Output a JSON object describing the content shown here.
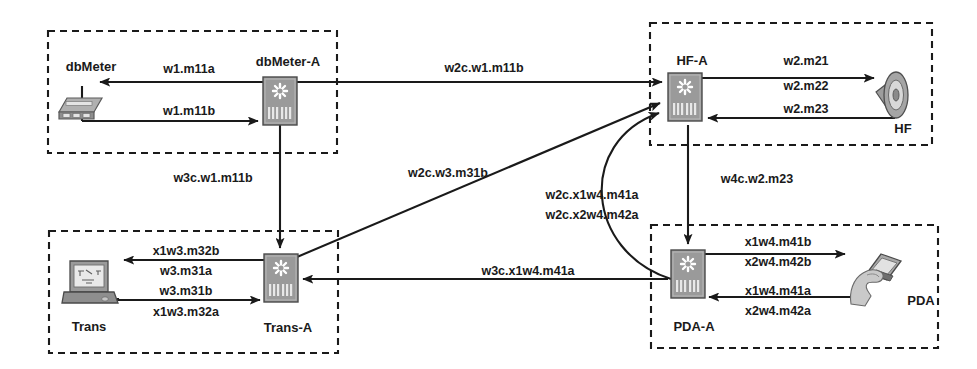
{
  "diagram": {
    "background_color": "#ffffff",
    "line_color": "#1a1a1a",
    "device_fill": "#9a9a9a",
    "device_stroke": "#4a4a4a"
  },
  "groups": [
    {
      "id": "dbmeter-group",
      "x": 48,
      "y": 31,
      "w": 289,
      "h": 122
    },
    {
      "id": "hf-group",
      "x": 650,
      "y": 23,
      "w": 282,
      "h": 122
    },
    {
      "id": "trans-group",
      "x": 49,
      "y": 231,
      "w": 289,
      "h": 122
    },
    {
      "id": "pda-group",
      "x": 651,
      "y": 225,
      "w": 287,
      "h": 123
    }
  ],
  "nodes": [
    {
      "id": "dbmeter",
      "label": "dbMeter",
      "kind": "meter-device",
      "label_x": 91,
      "label_y": 68,
      "icon_x": 60,
      "icon_y": 92,
      "icon_w": 46,
      "icon_h": 30
    },
    {
      "id": "dbmeter-a",
      "label": "dbMeter-A",
      "kind": "switch-device",
      "label_x": 288,
      "label_y": 63,
      "icon_x": 263,
      "icon_y": 77,
      "icon_w": 34,
      "icon_h": 48
    },
    {
      "id": "hf-a",
      "label": "HF-A",
      "kind": "switch-device",
      "label_x": 692,
      "label_y": 62,
      "icon_x": 668,
      "icon_y": 73,
      "icon_w": 34,
      "icon_h": 48
    },
    {
      "id": "hf",
      "label": "HF",
      "kind": "speaker-device",
      "label_x": 903,
      "label_y": 130,
      "icon_x": 880,
      "icon_y": 74,
      "icon_w": 34,
      "icon_h": 46
    },
    {
      "id": "trans",
      "label": "Trans",
      "kind": "laptop-device",
      "label_x": 89,
      "label_y": 328,
      "icon_x": 62,
      "icon_y": 259,
      "icon_w": 56,
      "icon_h": 52
    },
    {
      "id": "trans-a",
      "label": "Trans-A",
      "kind": "switch-device",
      "label_x": 288,
      "label_y": 329,
      "icon_x": 264,
      "icon_y": 254,
      "icon_w": 34,
      "icon_h": 48
    },
    {
      "id": "pda-a",
      "label": "PDA-A",
      "kind": "switch-device",
      "label_x": 694,
      "label_y": 328,
      "icon_x": 671,
      "icon_y": 250,
      "icon_w": 34,
      "icon_h": 48
    },
    {
      "id": "pda",
      "label": "PDA",
      "kind": "pda-device",
      "label_x": 921,
      "label_y": 302,
      "icon_x": 843,
      "icon_y": 255,
      "icon_w": 62,
      "icon_h": 56
    }
  ],
  "links": [
    {
      "id": "dbmeter-in",
      "label": "w1.m11a",
      "label_x": 189,
      "label_y": 70,
      "path": "M 263 82 L 100 82",
      "arrow": "end"
    },
    {
      "id": "dbmeter-out",
      "label": "w1.m11b",
      "label_x": 189,
      "label_y": 113,
      "path": "M 82 121 L 260 121",
      "arrow": "end"
    },
    {
      "id": "dbmeter-a-to-hf-a",
      "label": "w2c.w1.m11b",
      "label_x": 484,
      "label_y": 69,
      "path": "M 298 82 L 664 82",
      "arrow": "end"
    },
    {
      "id": "dbmeter-a-to-trans-a",
      "label": "w3c.w1.m11b",
      "label_x": 213,
      "label_y": 179,
      "path": "M 280 125 L 280 250",
      "arrow": "end"
    },
    {
      "id": "hf-a-to-hf-m21",
      "label": "w2.m21",
      "label_x": 806,
      "label_y": 62,
      "path": "M 702 78 L 878 78",
      "arrow": "end"
    },
    {
      "id": "hf-a-hf-m22",
      "label": "w2.m22",
      "label_x": 806,
      "label_y": 86,
      "path": "",
      "arrow": "none"
    },
    {
      "id": "hf-to-hf-a-m23",
      "label": "w2.m23",
      "label_x": 806,
      "label_y": 111,
      "path": "M 884 118 L 706 118",
      "arrow": "end"
    },
    {
      "id": "hf-a-to-pda-a",
      "label": "w4c.w2.m23",
      "label_x": 757,
      "label_y": 180,
      "path": "M 688 125 L 688 246",
      "arrow": "end"
    },
    {
      "id": "trans-a-to-hf-a",
      "label": "w2c.w3.m31b",
      "label_x": 448,
      "label_y": 174,
      "path": "M 296 258 L 662 105",
      "arrow": "end"
    },
    {
      "id": "pda-a-to-hf-a-1",
      "label": "w2c.x1w4.m41a",
      "label_x": 592,
      "label_y": 196,
      "path": "M 672 277 C 590 250 580 140 662 114",
      "arrow": "end"
    },
    {
      "id": "pda-a-to-hf-a-2",
      "label": "w2c.x2w4.m42a",
      "label_x": 592,
      "label_y": 215,
      "path": "",
      "arrow": "none"
    },
    {
      "id": "pda-a-to-trans-a",
      "label": "w3c.x1w4.m41a",
      "label_x": 528,
      "label_y": 272,
      "path": "M 668 279 L 302 279",
      "arrow": "end"
    },
    {
      "id": "trans-in-m32b",
      "label": "x1w3.m32b",
      "label_x": 186,
      "label_y": 252,
      "path": "M 264 260 L 122 260",
      "arrow": "end"
    },
    {
      "id": "trans-m31a",
      "label": "w3.m31a",
      "label_x": 186,
      "label_y": 272,
      "path": "",
      "arrow": "none"
    },
    {
      "id": "trans-out-m31b",
      "label": "w3.m31b",
      "label_x": 186,
      "label_y": 293,
      "path": "M 118 300 L 262 300",
      "arrow": "end"
    },
    {
      "id": "trans-m32a",
      "label": "x1w3.m32a",
      "label_x": 186,
      "label_y": 313,
      "path": "",
      "arrow": "none"
    },
    {
      "id": "pda-a-to-pda-m41b",
      "label": "x1w4.m41b",
      "label_x": 778,
      "label_y": 243,
      "path": "M 705 254 L 843 254",
      "arrow": "end"
    },
    {
      "id": "pda-m42b",
      "label": "x2w4.m42b",
      "label_x": 778,
      "label_y": 262,
      "path": "",
      "arrow": "none"
    },
    {
      "id": "pda-to-pda-a-m41a",
      "label": "x1w4.m41a",
      "label_x": 778,
      "label_y": 292,
      "path": "M 847 297 L 707 297",
      "arrow": "end"
    },
    {
      "id": "pda-m42a",
      "label": "x2w4.m42a",
      "label_x": 778,
      "label_y": 311,
      "path": "",
      "arrow": "none"
    }
  ],
  "stub_lines": [
    {
      "id": "dbmeter-stub-vert",
      "path": "M 82 86 L 82 121"
    },
    {
      "id": "trans-stub-vert",
      "path": "M 118 282 L 118 300"
    }
  ]
}
